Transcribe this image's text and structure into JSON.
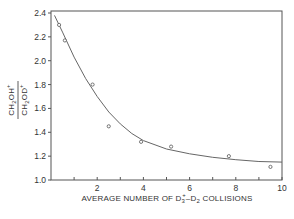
{
  "chart_data": {
    "type": "scatter",
    "title": "",
    "xlabel": "AVERAGE NUMBER OF D3+-D2 COLLISIONS",
    "xlabel_parts": {
      "pre": "AVERAGE  NUMBER  OF  D",
      "sub": "3",
      "sup": "+",
      "post": "–D",
      "sub2": "2",
      "end": "  COLLISIONS"
    },
    "ylabel": "CH2OH+ / CH2OD+",
    "ylabel_parts": {
      "num": "CH",
      "num_sub": "2",
      "num_end": "OH",
      "sup": "+",
      "den": "CH",
      "den_sub": "2",
      "den_end": "OD"
    },
    "xlim": [
      0,
      10
    ],
    "ylim": [
      1.0,
      2.4
    ],
    "xticks": [
      1,
      2,
      3,
      4,
      5,
      6,
      7,
      8,
      9,
      10
    ],
    "xtick_labels": [
      "2",
      "4",
      "6",
      "8",
      "10"
    ],
    "xtick_label_values": [
      2,
      4,
      6,
      8,
      10
    ],
    "yticks": [
      1.0,
      1.2,
      1.4,
      1.6,
      1.8,
      2.0,
      2.2,
      2.4
    ],
    "ytick_labels": [
      "1.0",
      "1.2",
      "1.4",
      "1.6",
      "1.8",
      "2.0",
      "2.2",
      "2.4"
    ],
    "grid": false,
    "legend": null,
    "series": [
      {
        "name": "measured",
        "marker": "open-circle",
        "x": [
          0.35,
          0.6,
          1.8,
          2.5,
          3.9,
          5.2,
          7.7,
          9.5
        ],
        "y": [
          2.3,
          2.17,
          1.8,
          1.45,
          1.32,
          1.28,
          1.2,
          1.11
        ]
      },
      {
        "name": "fit",
        "line": "solid",
        "x": [
          0.15,
          0.5,
          1.0,
          1.5,
          2.0,
          2.5,
          3.0,
          3.5,
          4.0,
          5.0,
          6.0,
          7.0,
          8.0,
          9.0,
          10.0
        ],
        "y": [
          2.38,
          2.24,
          2.03,
          1.85,
          1.7,
          1.57,
          1.47,
          1.39,
          1.33,
          1.26,
          1.22,
          1.19,
          1.17,
          1.155,
          1.15
        ]
      }
    ]
  }
}
